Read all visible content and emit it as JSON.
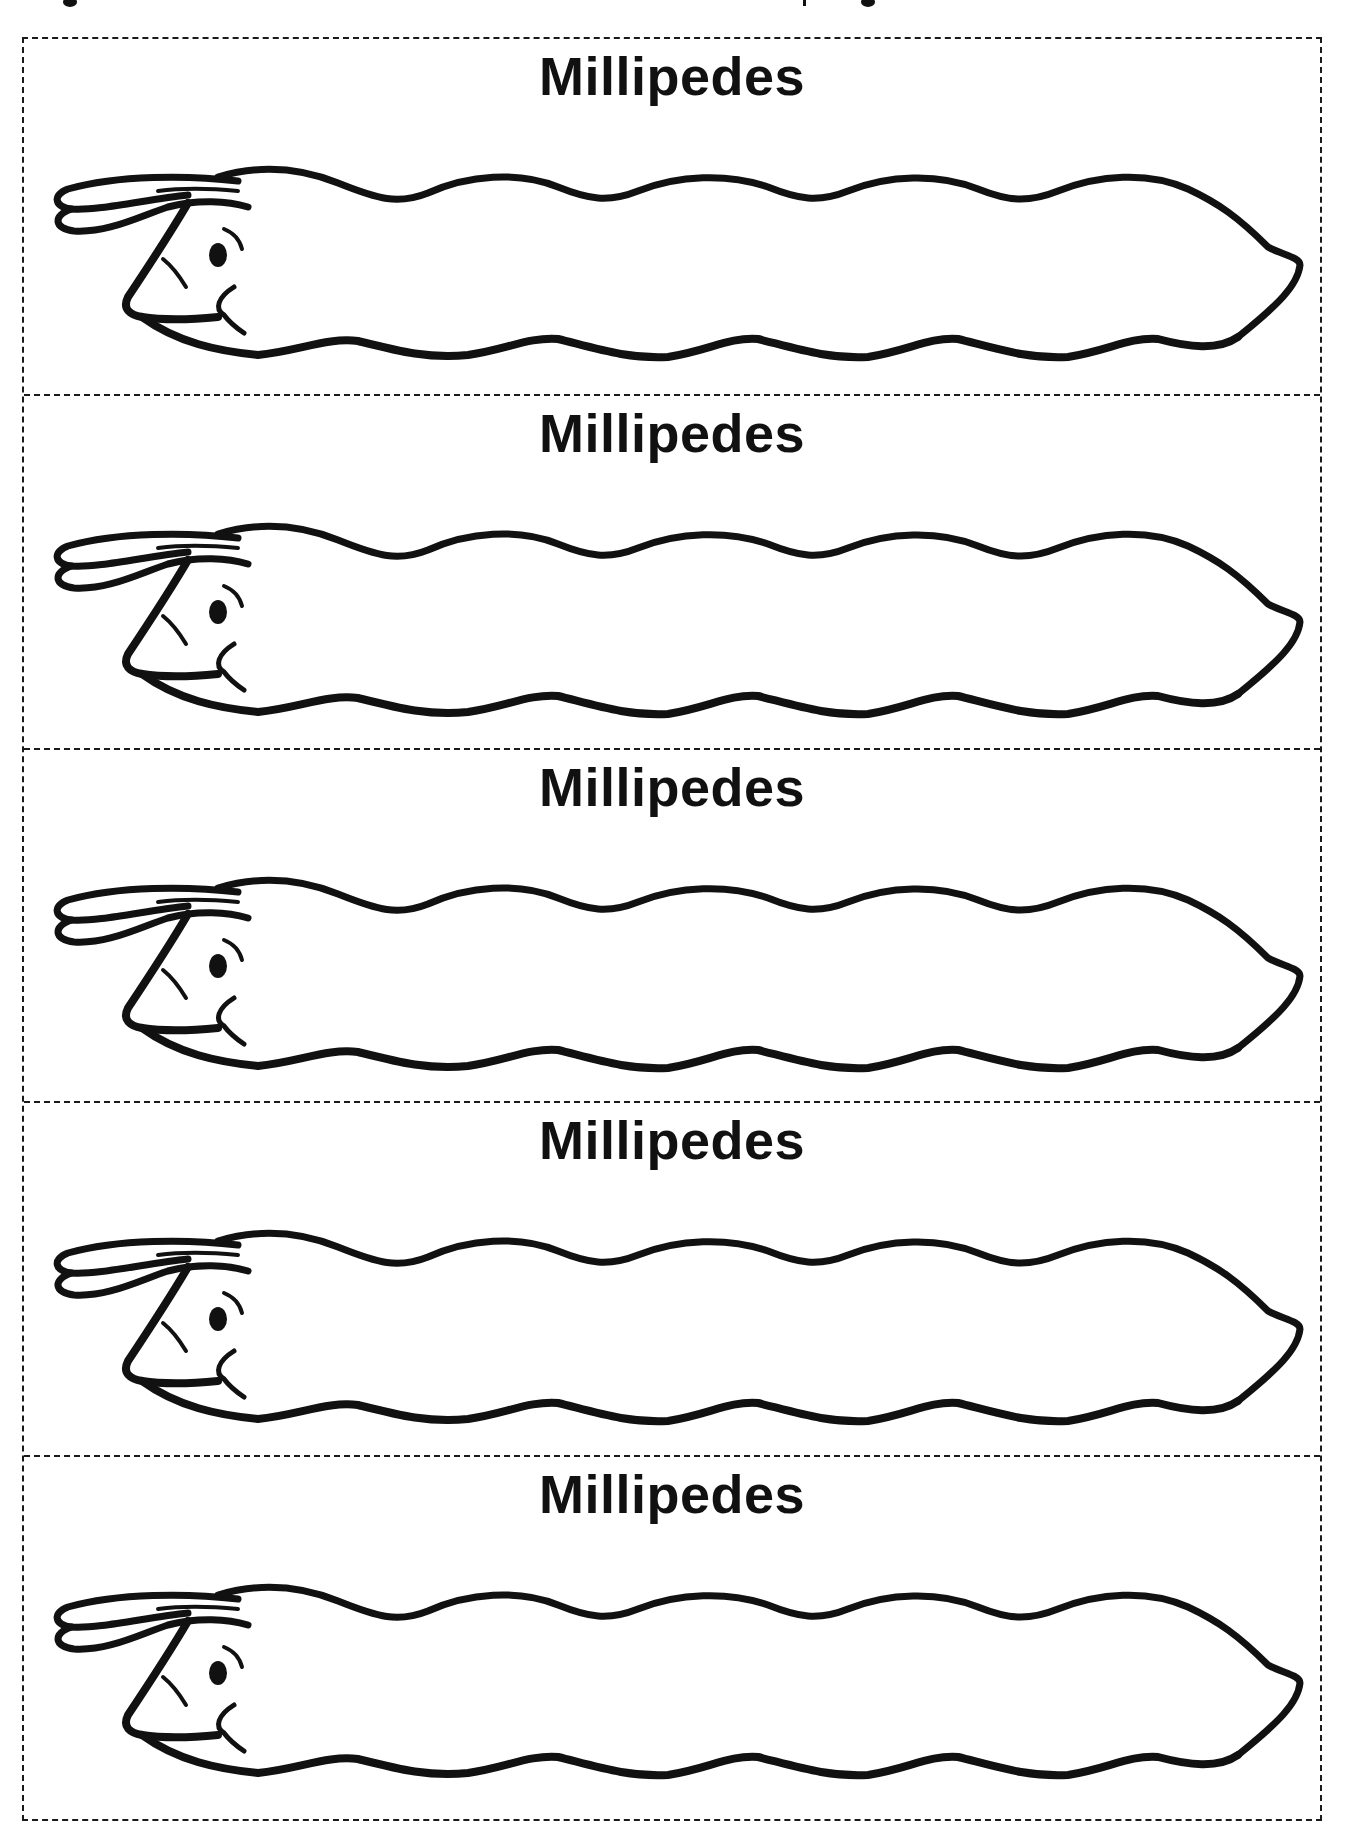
{
  "page": {
    "type": "printable cut-out worksheet",
    "strip_count": 5
  },
  "strips": [
    {
      "title": "Millipedes",
      "figure": "millipede-outline"
    },
    {
      "title": "Millipedes",
      "figure": "millipede-outline"
    },
    {
      "title": "Millipedes",
      "figure": "millipede-outline"
    },
    {
      "title": "Millipedes",
      "figure": "millipede-outline"
    },
    {
      "title": "Millipedes",
      "figure": "millipede-outline"
    }
  ],
  "colors": {
    "ink": "#111111",
    "background": "#ffffff",
    "cut_line": "#1a1a1a"
  }
}
